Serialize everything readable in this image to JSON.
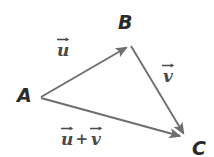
{
  "diagram": {
    "background_color": "#ffffff",
    "vector_color": "#6e6e6e",
    "label_color": "#4a4a4a",
    "point_label_color": "#2b2b2b",
    "points": {
      "A": {
        "label": "A",
        "x": 41,
        "y": 97
      },
      "B": {
        "label": "B",
        "x": 130,
        "y": 45
      },
      "C": {
        "label": "C",
        "x": 187,
        "y": 140
      }
    },
    "vectors": [
      {
        "name": "u",
        "letter": "u",
        "from": "A",
        "to": "B",
        "label_text": "u",
        "has_overarrow": true
      },
      {
        "name": "v",
        "letter": "v",
        "from": "B",
        "to": "C",
        "label_text": "v",
        "has_overarrow": true
      },
      {
        "name": "u-plus-v",
        "letter": "u",
        "second_letter": "v",
        "operator": "+",
        "from": "A",
        "to": "C",
        "label_text": "u + v",
        "has_overarrow": true
      }
    ]
  }
}
